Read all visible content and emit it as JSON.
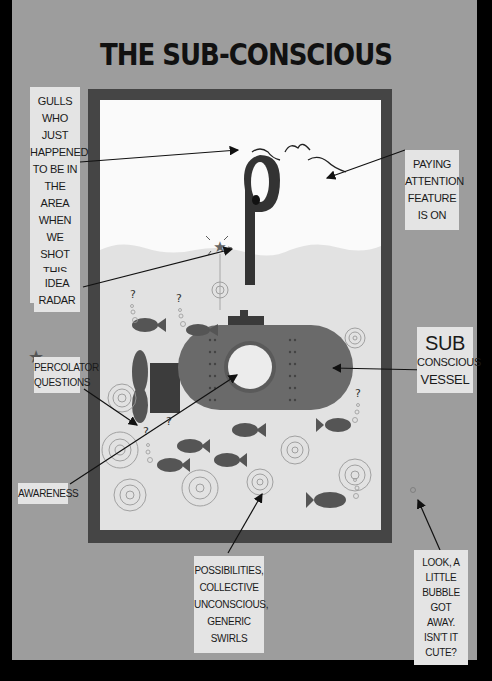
{
  "title": "THE SUB-CONSCIOUS",
  "colors": {
    "page_background": "#9d9d9d",
    "outer_border": "#000000",
    "frame": "#454545",
    "scene_background": "#fafafa",
    "water": "#e2e2e2",
    "label_background": "#e4e4e4",
    "submarine": "#6a6a6a",
    "text": "#1a1a1a"
  },
  "labels": {
    "gulls": {
      "lines": [
        "GULLS",
        "WHO JUST",
        "HAPPENED",
        "TO BE IN",
        "THE AREA",
        "WHEN WE",
        "SHOT",
        "THIS PHOTO"
      ]
    },
    "idea_radar": {
      "lines": [
        "IDEA",
        "RADAR"
      ]
    },
    "percolator": {
      "lines": [
        "PERCOLATOR",
        "QUESTIONS"
      ]
    },
    "awareness": {
      "lines": [
        "AWARENESS"
      ]
    },
    "paying_attention": {
      "lines": [
        "PAYING",
        "ATTENTION",
        "FEATURE",
        "IS ON"
      ]
    },
    "vessel": {
      "line1": "SUB",
      "line2": "CONSCIOUS",
      "line3": "VESSEL"
    },
    "possibilities": {
      "lines": [
        "POSSIBILITIES,",
        "COLLECTIVE",
        "UNCONSCIOUS,",
        "GENERIC SWIRLS"
      ]
    },
    "bubble": {
      "lines": [
        "LOOK, A",
        "LITTLE",
        "BUBBLE GOT",
        "AWAY.",
        "ISN'T IT CUTE?"
      ]
    }
  },
  "icons": {
    "star": "★",
    "question": "?"
  }
}
